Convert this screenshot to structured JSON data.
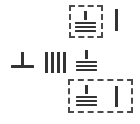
{
  "canvas": {
    "width": 140,
    "height": 124,
    "background": "#ffffff",
    "stroke_color": "#333333",
    "selection_border_color": "#4a4a4a"
  },
  "symbols": {
    "ground_label": "chassis-ground-symbol",
    "tee_label": "earth-tee-symbol",
    "tally_label": "tally-bars-four",
    "vbar_label": "vertical-bar-glyph",
    "tally_count": 4,
    "ground_bar_count": 3
  },
  "groups": [
    {
      "name": "top-selection-group",
      "selected": true,
      "box": {
        "x": 69,
        "y": 5,
        "width": 34,
        "height": 33
      },
      "items": [
        {
          "type": "chassis-ground",
          "x": 75,
          "y": 11
        },
        {
          "type": "vertical-bar",
          "x": 115,
          "y": 9,
          "height": 22
        }
      ]
    },
    {
      "name": "middle-row-group",
      "selected": false,
      "items": [
        {
          "type": "earth-tee",
          "x": 11,
          "y": 52
        },
        {
          "type": "tally-bars",
          "x": 45,
          "y": 52,
          "count": 4
        },
        {
          "type": "chassis-ground",
          "x": 76,
          "y": 50
        }
      ]
    },
    {
      "name": "bottom-selection-group",
      "selected": true,
      "box": {
        "x": 68,
        "y": 79,
        "width": 65,
        "height": 34
      },
      "items": [
        {
          "type": "chassis-ground",
          "x": 76,
          "y": 85
        },
        {
          "type": "vertical-bar",
          "x": 115,
          "y": 86,
          "height": 21
        }
      ]
    }
  ]
}
